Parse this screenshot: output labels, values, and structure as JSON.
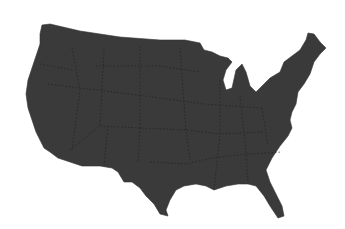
{
  "map": {
    "title": "",
    "region": "Contiguous United States",
    "fill_color": "#3a3a3a",
    "border_color": "#1e1e1e",
    "background_color": "#ffffff",
    "state_borders": "dotted"
  }
}
